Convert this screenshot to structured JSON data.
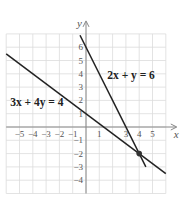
{
  "chart_data": {
    "type": "line",
    "title": "",
    "xlabel": "x",
    "ylabel": "y",
    "xlim": [
      -6,
      6
    ],
    "ylim": [
      -5,
      7
    ],
    "grid": true,
    "x_ticks": [
      -5,
      -4,
      -3,
      -2,
      -1,
      1,
      3,
      4,
      5
    ],
    "y_ticks": [
      6,
      5,
      4,
      3,
      2,
      1,
      -1,
      -2,
      -3,
      -4
    ],
    "series": [
      {
        "name": "2x + y = 6",
        "label": "2x + y = 6",
        "equation": {
          "a": 2,
          "b": 1,
          "c": 6
        },
        "x": [
          -0.45,
          4.5
        ],
        "y": [
          6.9,
          -3
        ]
      },
      {
        "name": "3x + 4y = 4",
        "label": "3x + 4y = 4",
        "equation": {
          "a": 3,
          "b": 4,
          "c": 4
        },
        "x": [
          -6,
          6
        ],
        "y": [
          5.5,
          -3.5
        ]
      }
    ],
    "annotations": [
      {
        "type": "point",
        "x": 4,
        "y": -2,
        "label": "intersection"
      },
      {
        "type": "text",
        "text": "2x + y = 6",
        "x": 1.6,
        "y": 3.6
      },
      {
        "type": "text",
        "text": "3x + 4y = 4",
        "x": -5.7,
        "y": 1.6
      }
    ]
  },
  "labels": {
    "x_axis": "x",
    "y_axis": "y",
    "eq1": "2x + y = 6",
    "eq2": "3x + 4y = 4"
  }
}
